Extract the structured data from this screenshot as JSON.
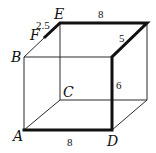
{
  "diagram": {
    "type": "rectangular-prism",
    "vertices": {
      "A": {
        "label": "A",
        "x": 24,
        "y": 130
      },
      "B": {
        "label": "B",
        "x": 24,
        "y": 57
      },
      "C": {
        "label": "C",
        "x": 60,
        "y": 100
      },
      "D": {
        "label": "D",
        "x": 112,
        "y": 130
      },
      "E": {
        "label": "E",
        "x": 60,
        "y": 23
      },
      "F": {
        "label": "F",
        "x": 45,
        "y": 37
      },
      "G": {
        "label": "",
        "x": 147,
        "y": 23
      },
      "H": {
        "label": "",
        "x": 112,
        "y": 57
      },
      "I": {
        "label": "",
        "x": 147,
        "y": 100
      }
    },
    "labels": {
      "A": "A",
      "B": "B",
      "C": "C",
      "D": "D",
      "E": "E",
      "F": "F"
    },
    "measurements": {
      "FE": "2.5",
      "top_edge": "8",
      "depth_right": "5",
      "height_right": "6",
      "bottom_edge": "8"
    },
    "bold_path": [
      "F",
      "E",
      "G",
      "H",
      "D",
      "A"
    ],
    "colors": {
      "line": "#2a2a2a",
      "bold": "#111111",
      "background": "#ffffff"
    }
  }
}
